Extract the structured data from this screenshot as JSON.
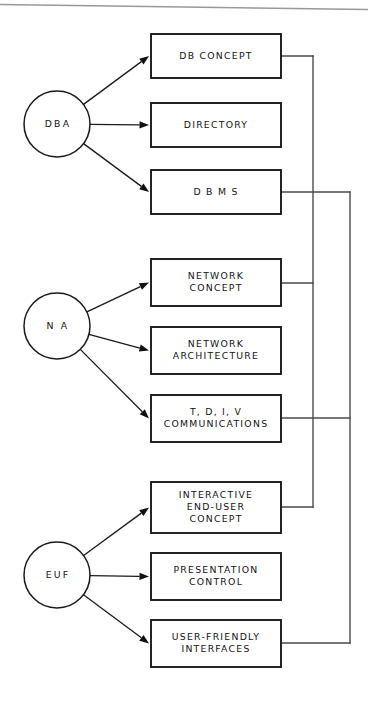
{
  "diagram": {
    "type": "flow-diagram",
    "background_color": "#ffffff",
    "line_color": "#1a1a1a",
    "roles": [
      {
        "id": "dba",
        "label": "DBA",
        "cx": 57,
        "cy": 124,
        "r": 33
      },
      {
        "id": "na",
        "label": "N A",
        "cx": 57,
        "cy": 326,
        "r": 33
      },
      {
        "id": "euf",
        "label": "EUF",
        "cx": 57,
        "cy": 575,
        "r": 33
      }
    ],
    "topics": [
      {
        "id": "db-concept",
        "lines": [
          "DB  CONCEPT"
        ],
        "x": 151,
        "y": 34,
        "w": 130,
        "h": 44,
        "role": "dba"
      },
      {
        "id": "directory",
        "lines": [
          "DIRECTORY"
        ],
        "x": 151,
        "y": 103,
        "w": 130,
        "h": 44,
        "role": "dba"
      },
      {
        "id": "dbms",
        "lines": [
          "D B M S"
        ],
        "x": 151,
        "y": 170,
        "w": 130,
        "h": 44,
        "role": "dba"
      },
      {
        "id": "network-concept",
        "lines": [
          "NETWORK",
          "CONCEPT"
        ],
        "x": 151,
        "y": 259,
        "w": 130,
        "h": 47,
        "role": "na"
      },
      {
        "id": "network-arch",
        "lines": [
          "NETWORK",
          "ARCHITECTURE"
        ],
        "x": 151,
        "y": 327,
        "w": 130,
        "h": 47,
        "role": "na"
      },
      {
        "id": "tdiv-comms",
        "lines": [
          "T, D, I, V",
          "COMMUNICATIONS"
        ],
        "x": 151,
        "y": 395,
        "w": 130,
        "h": 47,
        "role": "na"
      },
      {
        "id": "interactive-enduser",
        "lines": [
          "INTERACTIVE",
          "END-USER",
          "CONCEPT"
        ],
        "x": 151,
        "y": 482,
        "w": 130,
        "h": 51,
        "role": "euf"
      },
      {
        "id": "presentation",
        "lines": [
          "PRESENTATION",
          "CONTROL"
        ],
        "x": 151,
        "y": 553,
        "w": 130,
        "h": 47,
        "role": "euf"
      },
      {
        "id": "user-friendly",
        "lines": [
          "USER-FRIENDLY",
          "INTERFACES"
        ],
        "x": 151,
        "y": 620,
        "w": 130,
        "h": 47,
        "role": "euf"
      }
    ],
    "bus_lines": [
      {
        "id": "bus-inner",
        "x": 313,
        "y_top": 56,
        "y_bottom": 507
      },
      {
        "id": "bus-outer",
        "x": 350,
        "y_top": 192,
        "y_bottom": 643
      }
    ],
    "bus_stubs": [
      {
        "id": "stub-db-concept",
        "from_x": 281,
        "to_x": 313,
        "y": 56
      },
      {
        "id": "stub-dbms",
        "from_x": 281,
        "to_x": 350,
        "y": 192
      },
      {
        "id": "stub-net-concept",
        "from_x": 281,
        "to_x": 313,
        "y": 283
      },
      {
        "id": "stub-tdiv",
        "from_x": 281,
        "to_x": 350,
        "y": 418
      },
      {
        "id": "stub-interactive",
        "from_x": 281,
        "to_x": 313,
        "y": 507
      },
      {
        "id": "stub-userfriendly",
        "from_x": 281,
        "to_x": 350,
        "y": 643
      }
    ]
  }
}
